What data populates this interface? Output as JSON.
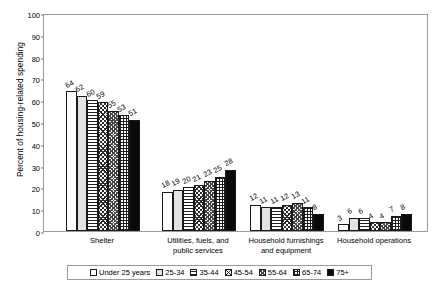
{
  "chart_data": {
    "type": "bar",
    "title": "",
    "xlabel": "",
    "ylabel": "Percent of housing-related spending",
    "ylim": [
      0,
      100
    ],
    "yticks": [
      0,
      10,
      20,
      30,
      40,
      50,
      60,
      70,
      80,
      90,
      100
    ],
    "grid": false,
    "legend_position": "bottom",
    "categories": [
      "Shelter",
      "Utilities, fuels, and public services",
      "Household furnishings and equipment",
      "Household operations"
    ],
    "category_lines": [
      [
        "Shelter"
      ],
      [
        "Utilities, fuels, and",
        "public services"
      ],
      [
        "Household furnishings",
        "and equipment"
      ],
      [
        "Household operations"
      ]
    ],
    "series": [
      {
        "name": "Under 25 years",
        "pattern": "white",
        "values": [
          64,
          18,
          12,
          3
        ]
      },
      {
        "name": "25-34",
        "pattern": "lightgray",
        "values": [
          62,
          19,
          11,
          6
        ]
      },
      {
        "name": "35-44",
        "pattern": "hlines",
        "values": [
          60,
          20,
          11,
          6
        ]
      },
      {
        "name": "45-54",
        "pattern": "dcross",
        "values": [
          59,
          21,
          12,
          4
        ]
      },
      {
        "name": "55-64",
        "pattern": "dots",
        "values": [
          55,
          23,
          13,
          4
        ]
      },
      {
        "name": "65-74",
        "pattern": "grid",
        "values": [
          53,
          25,
          11,
          7
        ]
      },
      {
        "name": "75+",
        "pattern": "black",
        "values": [
          51,
          28,
          8,
          8
        ]
      }
    ]
  }
}
